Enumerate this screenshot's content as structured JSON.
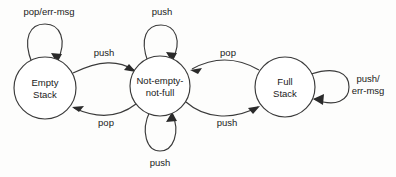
{
  "diagram": {
    "type": "state-transition-diagram",
    "background_color": "#fdfdfc",
    "stroke_color": "#3a3a3a",
    "text_color": "#1a1a1a",
    "states": [
      {
        "id": "empty",
        "label_line1": "Empty",
        "label_line2": "Stack",
        "cx": 45,
        "cy": 88,
        "r": 31
      },
      {
        "id": "not-empty-not-full",
        "label_line1": "Not-empty-",
        "label_line2": "not-full",
        "cx": 160,
        "cy": 86,
        "r": 30
      },
      {
        "id": "full",
        "label_line1": "Full",
        "label_line2": "Stack",
        "cx": 285,
        "cy": 87,
        "r": 30
      }
    ],
    "transitions": [
      {
        "id": "empty-self-loop",
        "from": "empty",
        "to": "empty",
        "label": "pop/err-msg",
        "label_x": 49,
        "label_y": 15
      },
      {
        "id": "empty-to-middle",
        "from": "empty",
        "to": "not-empty-not-full",
        "label": "push",
        "label_x": 104,
        "label_y": 56
      },
      {
        "id": "middle-to-empty",
        "from": "not-empty-not-full",
        "to": "empty",
        "label": "pop",
        "label_x": 106,
        "label_y": 126
      },
      {
        "id": "middle-self-loop-top",
        "from": "not-empty-not-full",
        "to": "not-empty-not-full",
        "label": "push",
        "label_x": 162,
        "label_y": 15
      },
      {
        "id": "middle-self-loop-bottom",
        "from": "not-empty-not-full",
        "to": "not-empty-not-full",
        "label": "push",
        "label_x": 160,
        "label_y": 166
      },
      {
        "id": "middle-to-full",
        "from": "not-empty-not-full",
        "to": "full",
        "label": "push",
        "label_x": 227,
        "label_y": 126
      },
      {
        "id": "full-to-middle",
        "from": "full",
        "to": "not-empty-not-full",
        "label": "pop",
        "label_x": 228,
        "label_y": 56
      },
      {
        "id": "full-self-loop",
        "from": "full",
        "to": "full",
        "label_line1": "push/",
        "label_line2": "err-msg",
        "label_x": 368,
        "label_y": 82
      }
    ]
  }
}
